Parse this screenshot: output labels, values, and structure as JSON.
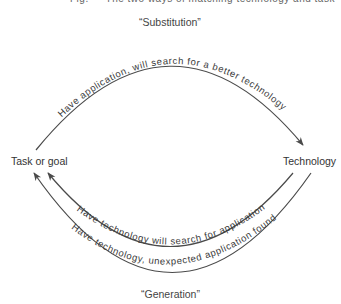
{
  "caption_cut_off": "Fig. — The two ways of matching technology and task",
  "nodes": {
    "left": "Task or goal",
    "right": "Technology"
  },
  "sections": {
    "top": "“Substitution”",
    "bottom": "“Generation”"
  },
  "arcs": {
    "top": "Have application, will search for a better technology",
    "bottom_inner": "Have technology will search for application",
    "bottom_outer": "Have technology, unexpected application found"
  },
  "colors": {
    "line": "#4a4a4a",
    "text": "#3a3a3a",
    "background": "#ffffff"
  }
}
